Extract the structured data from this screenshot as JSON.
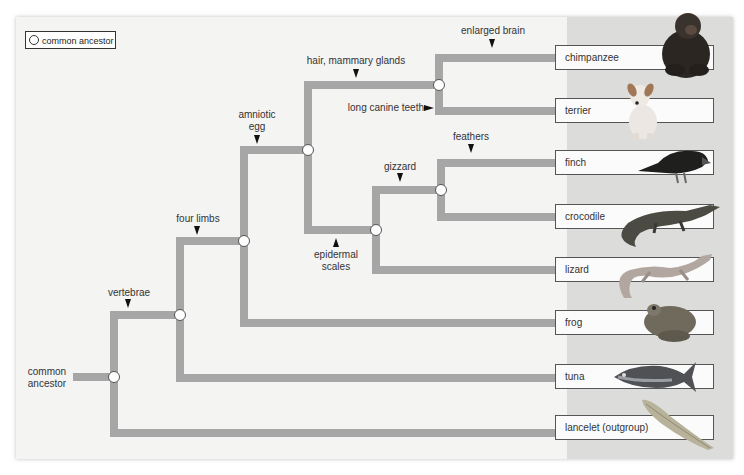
{
  "legend": {
    "label": "common ancestor"
  },
  "root_label": "common\nancestor",
  "root_label_lines": [
    "common",
    "ancestor"
  ],
  "colors": {
    "branch": "#a6a6a6",
    "panel": "#f4f4f3",
    "taxa_column": "#dcdcdb",
    "node_fill": "#ffffff",
    "node_stroke": "#555555"
  },
  "taxa": [
    {
      "name": "chimpanzee",
      "y": 58,
      "animal": "chimpanzee-image"
    },
    {
      "name": "terrier",
      "y": 111,
      "animal": "terrier-image"
    },
    {
      "name": "finch",
      "y": 163,
      "animal": "finch-image"
    },
    {
      "name": "crocodile",
      "y": 217,
      "animal": "crocodile-image"
    },
    {
      "name": "lizard",
      "y": 270,
      "animal": "lizard-image"
    },
    {
      "name": "frog",
      "y": 323,
      "animal": "frog-image"
    },
    {
      "name": "tuna",
      "y": 377,
      "animal": "tuna-image"
    },
    {
      "name": "lancelet (outgroup)",
      "y": 428,
      "animal": "lancelet-image"
    }
  ],
  "traits": [
    {
      "label": "vertebrae",
      "marker": "down"
    },
    {
      "label": "four limbs",
      "marker": "down"
    },
    {
      "label_lines": [
        "amniotic",
        "egg"
      ],
      "marker": "down"
    },
    {
      "label": "hair, mammary glands",
      "marker": "down"
    },
    {
      "label": "enlarged brain",
      "marker": "down"
    },
    {
      "label": "long canine teeth",
      "marker": "right"
    },
    {
      "label_lines": [
        "epidermal",
        "scales"
      ],
      "marker": "up"
    },
    {
      "label": "gizzard",
      "marker": "down"
    },
    {
      "label": "feathers",
      "marker": "down"
    }
  ],
  "nodes": [
    {
      "id": "root",
      "x": 114,
      "y": 377
    },
    {
      "id": "vertebrates",
      "x": 180,
      "y": 315
    },
    {
      "id": "tetrapods",
      "x": 244,
      "y": 241
    },
    {
      "id": "amniotes",
      "x": 308,
      "y": 150
    },
    {
      "id": "mammals",
      "x": 439,
      "y": 85
    },
    {
      "id": "reptiles",
      "x": 376,
      "y": 230
    },
    {
      "id": "archosaurs",
      "x": 441,
      "y": 190
    }
  ]
}
